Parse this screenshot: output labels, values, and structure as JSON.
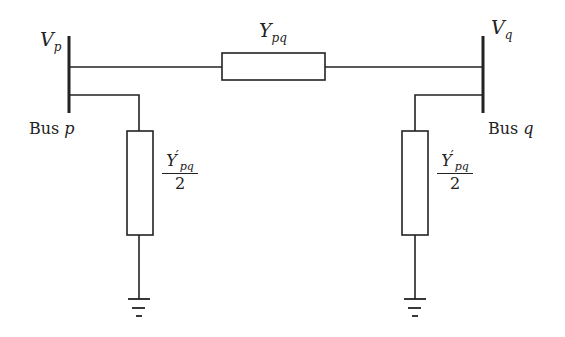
{
  "diagram": {
    "type": "pi-equivalent transmission line circuit",
    "bus_p": {
      "voltage_label": {
        "main": "V",
        "sub": "p"
      },
      "bus_label": {
        "text": "Bus ",
        "var": "p"
      }
    },
    "bus_q": {
      "voltage_label": {
        "main": "V",
        "sub": "q"
      },
      "bus_label": {
        "text": "Bus ",
        "var": "q"
      }
    },
    "series_admittance": {
      "main": "Y",
      "sub": "pq"
    },
    "shunt_admittance_left": {
      "main": "Y",
      "prime": "′",
      "sub": "pq",
      "denominator": "2"
    },
    "shunt_admittance_right": {
      "main": "Y",
      "prime": "′",
      "sub": "pq",
      "denominator": "2"
    },
    "colors": {
      "line": "#222222",
      "background": "#ffffff"
    }
  }
}
